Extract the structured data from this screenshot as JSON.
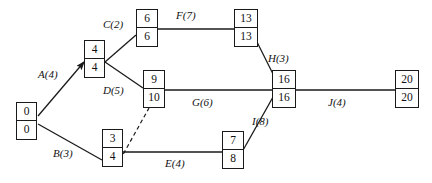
{
  "diagram": {
    "type": "activity-on-arrow-network",
    "stroke_color": "#1a1a1a",
    "background_color": "#ffffff",
    "nodes": [
      {
        "id": "start",
        "early": "0",
        "late": "0",
        "x": 16,
        "y": 102,
        "w": 21,
        "h": 38
      },
      {
        "id": "n4",
        "early": "4",
        "late": "4",
        "x": 84,
        "y": 40,
        "w": 21,
        "h": 38
      },
      {
        "id": "n34",
        "early": "3",
        "late": "4",
        "x": 102,
        "y": 129,
        "w": 21,
        "h": 38
      },
      {
        "id": "n66",
        "early": "6",
        "late": "6",
        "x": 136,
        "y": 9,
        "w": 22,
        "h": 38
      },
      {
        "id": "n910",
        "early": "9",
        "late": "10",
        "x": 143,
        "y": 70,
        "w": 22,
        "h": 38
      },
      {
        "id": "n78",
        "early": "7",
        "late": "8",
        "x": 222,
        "y": 131,
        "w": 22,
        "h": 38
      },
      {
        "id": "n1313",
        "early": "13",
        "late": "13",
        "x": 234,
        "y": 9,
        "w": 24,
        "h": 38
      },
      {
        "id": "n1616",
        "early": "16",
        "late": "16",
        "x": 272,
        "y": 70,
        "w": 24,
        "h": 38
      },
      {
        "id": "n2020",
        "early": "20",
        "late": "20",
        "x": 395,
        "y": 70,
        "w": 24,
        "h": 38
      }
    ],
    "edges": [
      {
        "id": "A",
        "name": "A",
        "duration": "4",
        "label": "A(4)",
        "from": "start",
        "to": "n4",
        "style": "solid",
        "label_x": 38,
        "label_y": 69
      },
      {
        "id": "B",
        "name": "B",
        "duration": "3",
        "label": "B(3)",
        "from": "start",
        "to": "n34",
        "style": "solid",
        "label_x": 53,
        "label_y": 148
      },
      {
        "id": "C",
        "name": "C",
        "duration": "2",
        "label": "C(2)",
        "from": "n4",
        "to": "n66",
        "style": "solid",
        "label_x": 103,
        "label_y": 19
      },
      {
        "id": "D",
        "name": "D",
        "duration": "5",
        "label": "D(5)",
        "from": "n4",
        "to": "n910",
        "style": "solid",
        "label_x": 103,
        "label_y": 85
      },
      {
        "id": "E",
        "name": "E",
        "duration": "4",
        "label": "E(4)",
        "from": "n34",
        "to": "n78",
        "style": "solid",
        "label_x": 165,
        "label_y": 158
      },
      {
        "id": "F",
        "name": "F",
        "duration": "7",
        "label": "F(7)",
        "from": "n66",
        "to": "n1313",
        "style": "solid",
        "label_x": 176,
        "label_y": 10
      },
      {
        "id": "G",
        "name": "G",
        "duration": "6",
        "label": "G(6)",
        "from": "n910",
        "to": "n1616",
        "style": "solid",
        "label_x": 192,
        "label_y": 97
      },
      {
        "id": "H",
        "name": "H",
        "duration": "3",
        "label": "H(3)",
        "from": "n1313",
        "to": "n1616",
        "style": "solid",
        "label_x": 268,
        "label_y": 53
      },
      {
        "id": "I",
        "name": "I",
        "duration": "8",
        "label": "I(8)",
        "from": "n78",
        "to": "n1616",
        "style": "solid",
        "label_x": 252,
        "label_y": 116
      },
      {
        "id": "J",
        "name": "J",
        "duration": "4",
        "label": "J(4)",
        "from": "n1616",
        "to": "n2020",
        "style": "solid",
        "label_x": 328,
        "label_y": 97
      },
      {
        "id": "dummy",
        "name": "",
        "duration": "",
        "label": "",
        "from": "n34",
        "to": "n910",
        "style": "dashed",
        "label_x": 0,
        "label_y": 0
      }
    ]
  }
}
